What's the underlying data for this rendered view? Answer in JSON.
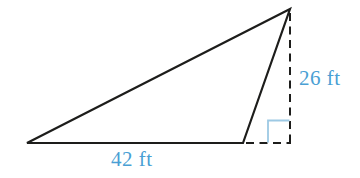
{
  "diagram": {
    "type": "geometry-triangle-with-external-height",
    "labels": {
      "height": "26 ft",
      "base": "42 ft"
    },
    "measurements": {
      "base_ft": 42,
      "height_ft": 26
    },
    "colors": {
      "line": "#1d1d1b",
      "label_text": "#4a9fd4",
      "right_angle_marker": "#9dc9e4",
      "background": "#ffffff"
    }
  }
}
